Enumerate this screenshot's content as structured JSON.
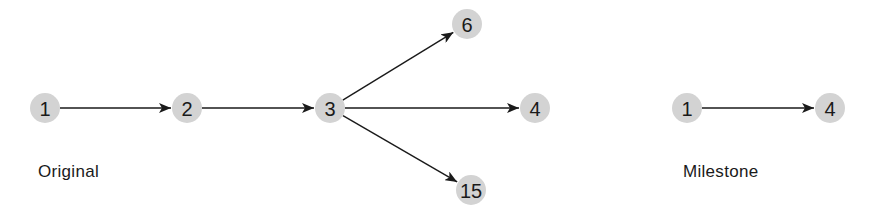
{
  "original": {
    "caption": "Original",
    "nodes": [
      {
        "id": "1",
        "label": "1",
        "x": 45,
        "y": 108
      },
      {
        "id": "2",
        "label": "2",
        "x": 187,
        "y": 108
      },
      {
        "id": "3",
        "label": "3",
        "x": 330,
        "y": 108
      },
      {
        "id": "6",
        "label": "6",
        "x": 467,
        "y": 24
      },
      {
        "id": "4",
        "label": "4",
        "x": 535,
        "y": 108
      },
      {
        "id": "15",
        "label": "15",
        "x": 471,
        "y": 190
      }
    ],
    "edges": [
      {
        "from": "1",
        "to": "2"
      },
      {
        "from": "2",
        "to": "3"
      },
      {
        "from": "3",
        "to": "6"
      },
      {
        "from": "3",
        "to": "4"
      },
      {
        "from": "3",
        "to": "15"
      }
    ]
  },
  "milestone": {
    "caption": "Milestone",
    "nodes": [
      {
        "id": "1",
        "label": "1",
        "x": 687,
        "y": 108
      },
      {
        "id": "4",
        "label": "4",
        "x": 830,
        "y": 108
      }
    ],
    "edges": [
      {
        "from": "1",
        "to": "4"
      }
    ]
  },
  "colors": {
    "node_fill": "#d3d3d3",
    "edge": "#1a1a1a",
    "text": "#1a1a1a"
  }
}
